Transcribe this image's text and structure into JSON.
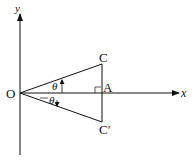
{
  "diagram": {
    "type": "geometry",
    "axes": {
      "x_label": "x",
      "y_label": "y"
    },
    "points": {
      "origin": "O",
      "upper": "C",
      "foot": "A",
      "lower": "C′"
    },
    "angles": {
      "upper": "θ",
      "lower": "θ"
    },
    "colors": {
      "stroke": "#111111",
      "background": "#ffffff"
    }
  }
}
